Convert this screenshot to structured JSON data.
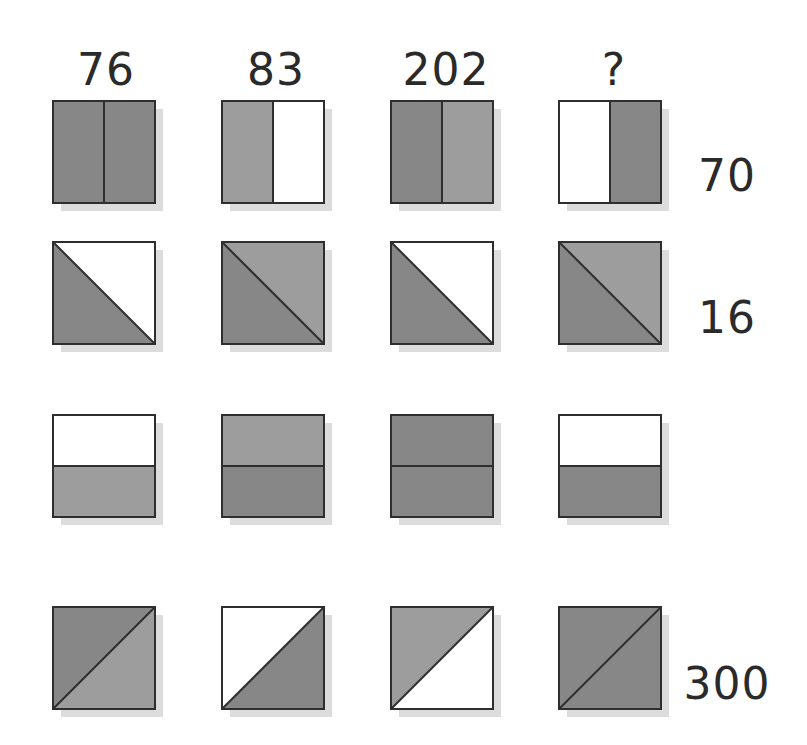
{
  "puzzle": {
    "column_headers": [
      "76",
      "83",
      "202",
      "?"
    ],
    "row_labels": [
      "70",
      "16",
      "",
      "300"
    ],
    "colors": {
      "dark": "#878787",
      "medium": "#9d9d9d",
      "white": "#ffffff",
      "outline": "#2e2e2e",
      "shadow": "#dcdcdc"
    },
    "rows": [
      {
        "split": "vertical",
        "tiles": [
          {
            "a": "dark",
            "b": "dark"
          },
          {
            "a": "medium",
            "b": "white"
          },
          {
            "a": "dark",
            "b": "medium"
          },
          {
            "a": "white",
            "b": "dark"
          }
        ]
      },
      {
        "split": "diagonal-down",
        "tiles": [
          {
            "a": "dark",
            "b": "white"
          },
          {
            "a": "dark",
            "b": "medium"
          },
          {
            "a": "dark",
            "b": "white"
          },
          {
            "a": "dark",
            "b": "medium"
          }
        ]
      },
      {
        "split": "horizontal",
        "tiles": [
          {
            "a": "white",
            "b": "medium"
          },
          {
            "a": "medium",
            "b": "dark"
          },
          {
            "a": "dark",
            "b": "dark"
          },
          {
            "a": "white",
            "b": "dark"
          }
        ]
      },
      {
        "split": "diagonal-up",
        "tiles": [
          {
            "a": "dark",
            "b": "medium"
          },
          {
            "a": "white",
            "b": "dark"
          },
          {
            "a": "medium",
            "b": "white"
          },
          {
            "a": "dark",
            "b": "dark"
          }
        ]
      }
    ]
  }
}
